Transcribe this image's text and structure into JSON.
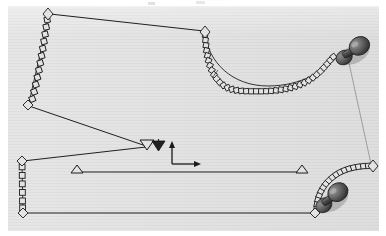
{
  "figure": {
    "kind": "scanned line-art engineering diagram",
    "canvas": {
      "width": 386,
      "height": 236
    },
    "plate": {
      "x": 8,
      "y": 6,
      "width": 371,
      "height": 225,
      "fill": "#e3e3e3"
    },
    "ink_color": "#1a1a1a",
    "line_color": "#222222",
    "faint_line_color": "#8a8a8a",
    "anchor_fill": "#555555",
    "anchor_highlight": "#9a9a9a",
    "anchor_shadow": "#2b2b2b"
  },
  "axis_indicator": {
    "name": "coordinate-axes",
    "origin": {
      "x": 172,
      "y": 164
    },
    "vertical_arrow": {
      "to_x": 172,
      "to_y": 142,
      "label": ""
    },
    "horizontal_arrow": {
      "to_x": 200,
      "to_y": 164,
      "label": ""
    }
  },
  "chains": [
    {
      "id": "chain-upper-left",
      "description": "vertical chain of square links descending from top-left diamond node",
      "from": {
        "x": 48,
        "y": 14
      },
      "to": {
        "x": 29,
        "y": 104
      },
      "link_count": 12,
      "link_shape": "square"
    },
    {
      "id": "chain-upper-right",
      "description": "catenary chain of square links sagging from upper diamond node to right anchor",
      "from": {
        "x": 205,
        "y": 31
      },
      "to": {
        "x": 337,
        "y": 54
      },
      "link_count": 34,
      "link_shape": "square",
      "sag_y": 88
    },
    {
      "id": "chain-lower-left",
      "description": "short vertical chain of square links on lower-left vertical member",
      "from": {
        "x": 22,
        "y": 161
      },
      "to": {
        "x": 23,
        "y": 212
      },
      "link_count": 6,
      "link_shape": "square"
    },
    {
      "id": "chain-lower-right",
      "description": "curved chain of square links from lower-right diamond node to lower anchor",
      "from": {
        "x": 372,
        "y": 166
      },
      "to": {
        "x": 316,
        "y": 212
      },
      "link_count": 22,
      "link_shape": "square"
    }
  ],
  "nodes": [
    {
      "id": "node-top-left",
      "shape": "diamond",
      "x": 48,
      "y": 13
    },
    {
      "id": "node-upper-mid",
      "shape": "diamond",
      "x": 205,
      "y": 31
    },
    {
      "id": "node-left-mid",
      "shape": "diamond",
      "x": 28,
      "y": 105
    },
    {
      "id": "node-left-lower",
      "shape": "diamond",
      "x": 22,
      "y": 162
    },
    {
      "id": "node-bottom-left",
      "shape": "diamond",
      "x": 23,
      "y": 213
    },
    {
      "id": "node-bottom-right",
      "shape": "diamond",
      "x": 315,
      "y": 213
    },
    {
      "id": "node-right-lower",
      "shape": "diamond",
      "x": 373,
      "y": 166
    }
  ],
  "anchors": [
    {
      "id": "anchor-upper-right",
      "shape": "pushpin",
      "x": 352,
      "y": 51,
      "rotation": -28
    },
    {
      "id": "anchor-lower-right",
      "shape": "pushpin",
      "x": 331,
      "y": 198,
      "rotation": -34
    }
  ],
  "markers": {
    "fairleads": [
      {
        "id": "fairlead-hollow",
        "shape": "triangle-down-hollow",
        "x": 147,
        "y": 145
      },
      {
        "id": "fairlead-filled",
        "shape": "triangle-down-filled",
        "x": 158,
        "y": 146
      }
    ],
    "supports": [
      {
        "id": "support-left",
        "shape": "triangle-up-hollow",
        "x": 77,
        "y": 172
      },
      {
        "id": "support-right",
        "shape": "triangle-up-hollow",
        "x": 302,
        "y": 172
      }
    ]
  },
  "segments": [
    {
      "id": "line-top-span",
      "x1": 50,
      "y1": 14,
      "x2": 204,
      "y2": 31,
      "weight": "normal"
    },
    {
      "id": "line-left-diagonal",
      "x1": 29,
      "y1": 106,
      "x2": 145,
      "y2": 146,
      "weight": "normal"
    },
    {
      "id": "line-lower-diagonal",
      "x1": 145,
      "y1": 147,
      "x2": 23,
      "y2": 161,
      "weight": "normal"
    },
    {
      "id": "line-seabed",
      "x1": 82,
      "y1": 172,
      "x2": 300,
      "y2": 172,
      "weight": "normal"
    },
    {
      "id": "line-bottom-span",
      "x1": 25,
      "y1": 213,
      "x2": 314,
      "y2": 213,
      "weight": "normal"
    },
    {
      "id": "line-right-riser",
      "x1": 349,
      "y1": 62,
      "x2": 372,
      "y2": 165,
      "weight": "faint"
    }
  ],
  "annotations": [
    {
      "id": "leader-tick",
      "description": "small leader tick near upper-right chain",
      "x": 214,
      "y": 72
    }
  ]
}
